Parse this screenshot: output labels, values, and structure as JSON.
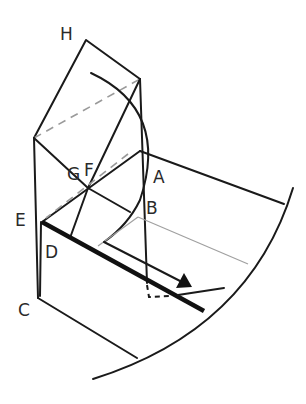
{
  "diagram": {
    "labels": {
      "H": "H",
      "G": "G",
      "F": "F",
      "A": "A",
      "B": "B",
      "E": "E",
      "D": "D",
      "C": "C"
    },
    "colors": {
      "line": "#1a1a1a",
      "guide": "#a0a0a0",
      "background": "#ffffff"
    }
  }
}
